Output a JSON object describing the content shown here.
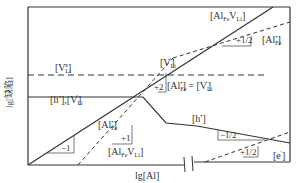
{
  "axes": {
    "x_label": "lg[Al]",
    "y_label": "lg[缺陷]"
  },
  "labels": {
    "v_li_top": "[V",
    "v_li_top_sub": "Li",
    "v_li_top_sup": "x",
    "al_fe_v_li_top": "[Al",
    "al_fe_v_li_top_sub1": "Fe",
    "al_fe_v_li_top_mid": "V",
    "al_fe_v_li_top_sub2": "Li",
    "al_fe_top_right": "[Al",
    "al_fe_top_right_sub": "Fe",
    "al_fe_top_right_sup": "•",
    "v_li_prime_mid": "[V",
    "v_li_prime_mid_sub": "Li",
    "v_li_prime_mid_sup": "′",
    "li_i_v_li": "[li",
    "li_i_v_li_sup": "•",
    "li_i_v_li_rest": "],[V",
    "li_i_v_li_sub": "Li",
    "li_i_v_li_sup2": "′",
    "equality": "[Al",
    "equality_sub": "Fe",
    "equality_sup": "•",
    "equality_rest": "] = [V",
    "equality_sub2": "Li",
    "equality_sup2": "′",
    "al_fe_left": "[Al",
    "al_fe_left_sub": "Fe",
    "al_fe_left_sup": "•",
    "al_fe_v_li_bottom": "[Al",
    "al_fe_v_li_bottom_sub1": "Fe",
    "al_fe_v_li_bottom_mid": "V",
    "al_fe_v_li_bottom_sub2": "Li",
    "h_dot": "[h",
    "h_dot_sup": "•",
    "e_prime": "[e",
    "e_prime_sup": "′",
    "close": "]"
  },
  "slopes": {
    "s_half_top": "+1/2",
    "s_plus2": "+2",
    "s_minus1": "−1",
    "s_plus1": "+1",
    "s_minus_half": "−1/2",
    "s_plus_half_bottom": "+1/2"
  },
  "colors": {
    "line": "#333333",
    "frame": "#333333",
    "text": "#333333"
  }
}
